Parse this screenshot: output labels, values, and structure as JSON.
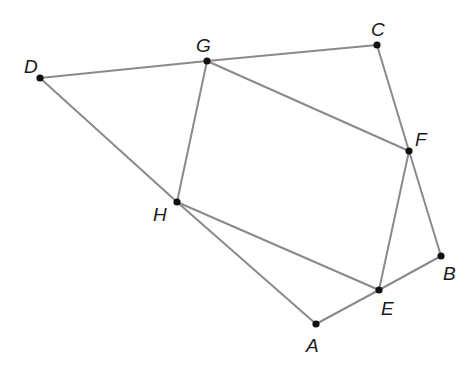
{
  "diagram": {
    "type": "geometry",
    "points": {
      "A": {
        "label": "A",
        "x": 316,
        "y": 324,
        "lx": 306,
        "ly": 352
      },
      "B": {
        "label": "B",
        "x": 441,
        "y": 256,
        "lx": 443,
        "ly": 280
      },
      "C": {
        "label": "C",
        "x": 377,
        "y": 45,
        "lx": 371,
        "ly": 36
      },
      "D": {
        "label": "D",
        "x": 40,
        "y": 78,
        "lx": 24,
        "ly": 73
      },
      "E": {
        "label": "E",
        "x": 379,
        "y": 290,
        "lx": 381,
        "ly": 315
      },
      "F": {
        "label": "F",
        "x": 409,
        "y": 151,
        "lx": 415,
        "ly": 146
      },
      "G": {
        "label": "G",
        "x": 207,
        "y": 61,
        "lx": 196,
        "ly": 52
      },
      "H": {
        "label": "H",
        "x": 177,
        "y": 202,
        "lx": 153,
        "ly": 221
      }
    },
    "segments": [
      [
        "D",
        "G"
      ],
      [
        "G",
        "C"
      ],
      [
        "C",
        "F"
      ],
      [
        "F",
        "B"
      ],
      [
        "B",
        "E"
      ],
      [
        "E",
        "A"
      ],
      [
        "A",
        "H"
      ],
      [
        "H",
        "D"
      ],
      [
        "G",
        "F"
      ],
      [
        "F",
        "E"
      ],
      [
        "E",
        "H"
      ],
      [
        "H",
        "G"
      ]
    ],
    "colors": {
      "line": "#8a8a8a",
      "point": "#111111",
      "label": "#1a1a1a"
    }
  }
}
